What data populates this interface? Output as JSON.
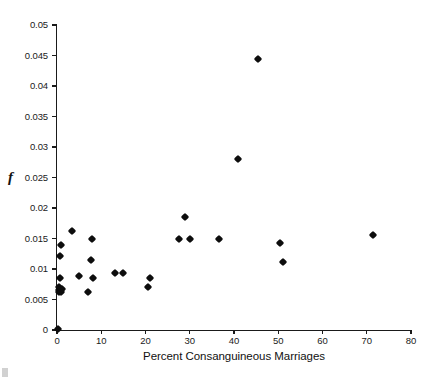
{
  "chart_data": {
    "type": "scatter",
    "title": "",
    "xlabel": "Percent Consanguineous Marriages",
    "ylabel": "f",
    "xlim": [
      0,
      80
    ],
    "ylim": [
      0,
      0.05
    ],
    "grid": false,
    "legend": null,
    "xticks": [
      0,
      10,
      20,
      30,
      40,
      50,
      60,
      70,
      80
    ],
    "xtick_labels": [
      "0",
      "10",
      "20",
      "30",
      "40",
      "50",
      "60",
      "70",
      "80"
    ],
    "yticks": [
      0,
      0.005,
      0.01,
      0.015,
      0.02,
      0.025,
      0.03,
      0.035,
      0.04,
      0.045,
      0.05
    ],
    "ytick_labels": [
      "0",
      "0.005",
      "0.01",
      "0.015",
      "0.02",
      "0.025",
      "0.03",
      "0.035",
      "0.04",
      "0.045",
      "0.05"
    ],
    "marker": "diamond",
    "marker_color": "#0d0d0d",
    "points": [
      {
        "x": 0.2,
        "y": 0.0002
      },
      {
        "x": 0.4,
        "y": 0.0062
      },
      {
        "x": 0.5,
        "y": 0.0066
      },
      {
        "x": 0.5,
        "y": 0.0071
      },
      {
        "x": 0.6,
        "y": 0.0086
      },
      {
        "x": 0.7,
        "y": 0.0122
      },
      {
        "x": 0.8,
        "y": 0.014
      },
      {
        "x": 1.0,
        "y": 0.0062
      },
      {
        "x": 1.1,
        "y": 0.0068
      },
      {
        "x": 3.5,
        "y": 0.0163
      },
      {
        "x": 5.0,
        "y": 0.0088
      },
      {
        "x": 7.0,
        "y": 0.0062
      },
      {
        "x": 7.6,
        "y": 0.0114
      },
      {
        "x": 8.0,
        "y": 0.015
      },
      {
        "x": 8.2,
        "y": 0.0086
      },
      {
        "x": 13.0,
        "y": 0.0094
      },
      {
        "x": 15.0,
        "y": 0.0094
      },
      {
        "x": 20.5,
        "y": 0.0071
      },
      {
        "x": 21.0,
        "y": 0.0086
      },
      {
        "x": 27.5,
        "y": 0.015
      },
      {
        "x": 29.0,
        "y": 0.0185
      },
      {
        "x": 30.0,
        "y": 0.015
      },
      {
        "x": 36.5,
        "y": 0.0149
      },
      {
        "x": 41.0,
        "y": 0.0281
      },
      {
        "x": 45.5,
        "y": 0.0445
      },
      {
        "x": 50.5,
        "y": 0.0143
      },
      {
        "x": 51.0,
        "y": 0.0112
      },
      {
        "x": 71.5,
        "y": 0.0156
      }
    ]
  }
}
